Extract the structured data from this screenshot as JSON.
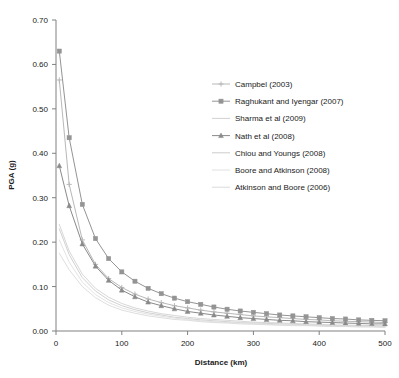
{
  "chart_data": {
    "type": "line",
    "title": "",
    "xlabel": "Distance (km)",
    "ylabel": "PGA (g)",
    "xlim": [
      0,
      500
    ],
    "ylim": [
      0.0,
      0.7
    ],
    "xticks": [
      0,
      100,
      200,
      300,
      400,
      500
    ],
    "yticks": [
      "0.00",
      "0.10",
      "0.20",
      "0.30",
      "0.40",
      "0.50",
      "0.60",
      "0.70"
    ],
    "ytick_values": [
      0.0,
      0.1,
      0.2,
      0.3,
      0.4,
      0.5,
      0.6,
      0.7
    ],
    "grid": false,
    "legend_position": "right",
    "x": [
      5,
      20,
      40,
      60,
      80,
      100,
      120,
      140,
      160,
      180,
      200,
      220,
      240,
      260,
      280,
      300,
      320,
      340,
      360,
      380,
      400,
      420,
      440,
      460,
      480,
      500
    ],
    "series": [
      {
        "name": "Campbel (2003)",
        "marker": "plus",
        "color": "#b8b8b8",
        "values": [
          0.565,
          0.33,
          0.205,
          0.15,
          0.118,
          0.098,
          0.083,
          0.072,
          0.064,
          0.057,
          0.052,
          0.047,
          0.043,
          0.04,
          0.037,
          0.034,
          0.032,
          0.03,
          0.028,
          0.026,
          0.025,
          0.023,
          0.022,
          0.021,
          0.02,
          0.019
        ]
      },
      {
        "name": "Raghukant and Iyengar (2007)",
        "marker": "square",
        "color": "#949494",
        "values": [
          0.63,
          0.435,
          0.285,
          0.208,
          0.163,
          0.133,
          0.112,
          0.096,
          0.084,
          0.074,
          0.066,
          0.06,
          0.054,
          0.049,
          0.045,
          0.042,
          0.039,
          0.036,
          0.034,
          0.032,
          0.03,
          0.028,
          0.027,
          0.025,
          0.024,
          0.023
        ]
      },
      {
        "name": "Sharma et al (2009)",
        "marker": "none",
        "color": "#d2d2d2",
        "values": [
          0.24,
          0.18,
          0.128,
          0.096,
          0.076,
          0.062,
          0.052,
          0.045,
          0.039,
          0.035,
          0.031,
          0.028,
          0.026,
          0.024,
          0.022,
          0.02,
          0.019,
          0.018,
          0.017,
          0.016,
          0.015,
          0.014,
          0.013,
          0.013,
          0.012,
          0.012
        ]
      },
      {
        "name": "Nath et al (2008)",
        "marker": "triangle",
        "color": "#8a8a8a",
        "values": [
          0.372,
          0.282,
          0.196,
          0.146,
          0.114,
          0.092,
          0.077,
          0.065,
          0.057,
          0.05,
          0.044,
          0.04,
          0.036,
          0.033,
          0.03,
          0.028,
          0.026,
          0.024,
          0.023,
          0.021,
          0.02,
          0.019,
          0.018,
          0.017,
          0.016,
          0.016
        ]
      },
      {
        "name": "Chiou and Youngs (2008)",
        "marker": "none",
        "color": "#cccccc",
        "values": [
          0.23,
          0.172,
          0.12,
          0.09,
          0.07,
          0.057,
          0.048,
          0.041,
          0.036,
          0.031,
          0.028,
          0.025,
          0.023,
          0.021,
          0.019,
          0.018,
          0.017,
          0.016,
          0.015,
          0.014,
          0.013,
          0.012,
          0.012,
          0.011,
          0.011,
          0.01
        ]
      },
      {
        "name": "Boore and Atkinson (2008)",
        "marker": "none",
        "color": "#e0e0e0",
        "values": [
          0.205,
          0.155,
          0.11,
          0.082,
          0.064,
          0.052,
          0.044,
          0.038,
          0.033,
          0.029,
          0.026,
          0.023,
          0.021,
          0.019,
          0.018,
          0.017,
          0.015,
          0.014,
          0.014,
          0.013,
          0.012,
          0.011,
          0.011,
          0.01,
          0.01,
          0.009
        ]
      },
      {
        "name": "Atkinson and Boore (2006)",
        "marker": "none",
        "color": "#dadada",
        "values": [
          0.175,
          0.138,
          0.1,
          0.075,
          0.058,
          0.047,
          0.04,
          0.034,
          0.03,
          0.026,
          0.024,
          0.021,
          0.019,
          0.018,
          0.016,
          0.015,
          0.014,
          0.013,
          0.012,
          0.012,
          0.011,
          0.01,
          0.01,
          0.009,
          0.009,
          0.008
        ]
      }
    ]
  },
  "legend": {
    "items": [
      {
        "label": "Campbel (2003)"
      },
      {
        "label": "Raghukant and Iyengar (2007)"
      },
      {
        "label": "Sharma et al (2009)"
      },
      {
        "label": "Nath et al (2008)"
      },
      {
        "label": "Chiou and Youngs (2008)"
      },
      {
        "label": "Boore and Atkinson (2008)"
      },
      {
        "label": "Atkinson and Boore (2006)"
      }
    ]
  },
  "axes": {
    "x_title": "Distance (km)",
    "y_title": "PGA (g)"
  },
  "colors": {
    "axis": "#808080",
    "text": "#1a1a1a",
    "background": "#ffffff"
  }
}
